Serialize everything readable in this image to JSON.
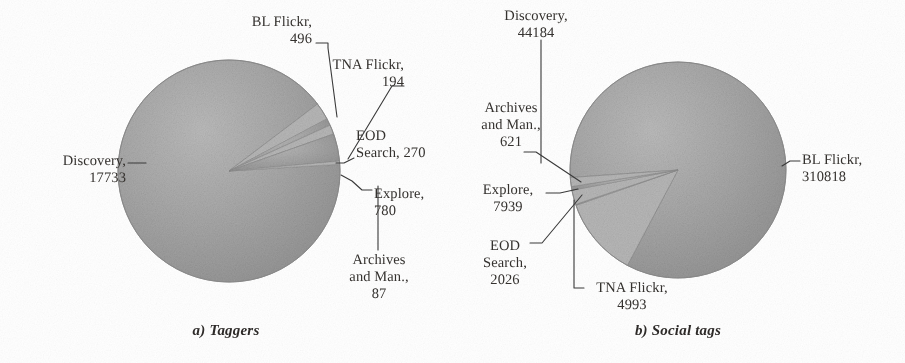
{
  "figure": {
    "background_color": "#ffffff",
    "text_color": "#35322f",
    "slice_color": "#a3a3a3",
    "slice_color_alt": "#b9b9b9",
    "leader_color": "#3a3a3a"
  },
  "panels": [
    {
      "id": "a",
      "caption": "a) Taggers",
      "callouts": [
        {
          "name": "discovery",
          "text": "Discovery,\n17733",
          "align": "right",
          "x": 18,
          "y": 153,
          "w": 108
        },
        {
          "name": "bl-flickr",
          "text": "BL Flickr,\n496",
          "align": "right",
          "x": 152,
          "y": 14,
          "w": 160
        },
        {
          "name": "tna-flickr",
          "text": "TNA Flickr,\n194",
          "align": "right",
          "x": 232,
          "y": 57,
          "w": 172
        },
        {
          "name": "eod-search",
          "text": "EOD\nSearch, 270",
          "align": "left",
          "x": 356,
          "y": 128,
          "w": 96
        },
        {
          "name": "explore",
          "text": "Explore,\n780",
          "align": "left",
          "x": 374,
          "y": 186,
          "w": 78
        },
        {
          "name": "archives",
          "text": "Archives\nand Man.,\n87",
          "align": "center",
          "x": 330,
          "y": 252,
          "w": 98
        }
      ]
    },
    {
      "id": "b",
      "caption": "b) Social tags",
      "callouts": [
        {
          "name": "discovery",
          "text": "Discovery,\n44184",
          "align": "center",
          "x": 20,
          "y": 8,
          "w": 128
        },
        {
          "name": "archives",
          "text": "Archives\nand Man.,\n621",
          "align": "center",
          "x": 0,
          "y": 100,
          "w": 118
        },
        {
          "name": "explore",
          "text": "Explore,\n7939",
          "align": "center",
          "x": 0,
          "y": 182,
          "w": 112
        },
        {
          "name": "eod-search",
          "text": "EOD\nSearch,\n2026",
          "align": "center",
          "x": 2,
          "y": 238,
          "w": 102
        },
        {
          "name": "tna-flickr",
          "text": "TNA Flickr,\n4993",
          "align": "center",
          "x": 118,
          "y": 280,
          "w": 124
        },
        {
          "name": "bl-flickr",
          "text": "BL Flickr,\n310818",
          "align": "left",
          "x": 350,
          "y": 152,
          "w": 104
        }
      ]
    }
  ],
  "chart_data": [
    {
      "type": "pie",
      "title": "a) Taggers",
      "labels": [
        "Discovery",
        "BL Flickr",
        "TNA Flickr",
        "EOD Search",
        "Explore",
        "Archives and Man."
      ],
      "values": [
        17733,
        496,
        194,
        270,
        780,
        87
      ],
      "total": 19560,
      "units": "taggers",
      "legend": "none",
      "data_labels": [
        "Discovery, 17733",
        "BL Flickr, 496",
        "TNA Flickr, 194",
        "EOD Search, 270",
        "Explore, 780",
        "Archives and Man., 87"
      ],
      "start_angle_deg": 0,
      "direction": "clockwise",
      "center": {
        "x": 229,
        "y": 171
      },
      "radius": 111
    },
    {
      "type": "pie",
      "title": "b) Social tags",
      "labels": [
        "BL Flickr",
        "Discovery",
        "Archives and Man.",
        "Explore",
        "EOD Search",
        "TNA Flickr"
      ],
      "values": [
        310818,
        44184,
        621,
        7939,
        2026,
        4993
      ],
      "total": 370581,
      "units": "social tags",
      "legend": "none",
      "data_labels": [
        "BL Flickr, 310818",
        "Discovery, 44184",
        "Archives and Man., 621",
        "Explore, 7939",
        "EOD Search, 2026",
        "TNA Flickr, 4993"
      ],
      "start_angle_deg": 0,
      "direction": "clockwise",
      "center": {
        "x": 226,
        "y": 170
      },
      "radius": 108
    }
  ]
}
